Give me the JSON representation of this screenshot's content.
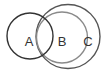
{
  "diagram": {
    "type": "venn",
    "circles": [
      {
        "id": "A",
        "label": "A",
        "cx": 30,
        "cy": 36,
        "r": 23,
        "stroke": "#333333",
        "label_x": 29,
        "label_y": 45.5
      },
      {
        "id": "B",
        "label": "B",
        "cx": 62,
        "cy": 37.5,
        "r": 25.5,
        "stroke": "#8a8a8a",
        "label_x": 62,
        "label_y": 46
      },
      {
        "id": "C",
        "label": "C",
        "cx": 68,
        "cy": 36.5,
        "r": 32,
        "stroke": "#555555",
        "label_x": 88,
        "label_y": 45.5
      }
    ],
    "relationships": [
      "A overlaps B",
      "A overlaps C",
      "B is a subset of C"
    ]
  }
}
